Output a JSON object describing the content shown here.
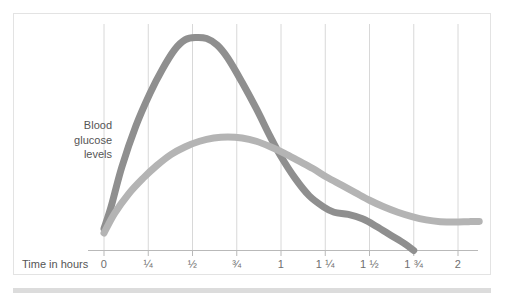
{
  "figure": {
    "name": "blood-glucose-time-chart",
    "panel_border_color": "#e3e3e3",
    "background_color": "#ffffff",
    "footer_bar_color": "#dcdcdc"
  },
  "chart_data": {
    "type": "line",
    "title": "",
    "xlabel": "Time in hours",
    "ylabel": "Blood glucose levels",
    "xlim": [
      0,
      2.125
    ],
    "ylim": [
      0,
      1
    ],
    "grid": true,
    "grid_axis": "x",
    "grid_color": "#d8d8d8",
    "axis_color": "#b9b9b9",
    "legend": "none",
    "xticks": [
      0,
      0.25,
      0.5,
      0.75,
      1,
      1.25,
      1.5,
      1.75,
      2
    ],
    "xticklabels": [
      "0",
      "¼",
      "½",
      "¾",
      "1",
      "1 ¼",
      "1 ½",
      "1 ¾",
      "2"
    ],
    "yticks": [],
    "yticklabels": [],
    "series": [
      {
        "name": "fast-acting-curve",
        "color": "#8f8f8f",
        "line_width": 7,
        "x": [
          0,
          0.04,
          0.1,
          0.18,
          0.26,
          0.33,
          0.4,
          0.46,
          0.52,
          0.58,
          0.64,
          0.7,
          0.78,
          0.86,
          0.94,
          1.0,
          1.08,
          1.16,
          1.24,
          1.3,
          1.38,
          1.46,
          1.54,
          1.62,
          1.7,
          1.75
        ],
        "y": [
          0.1,
          0.2,
          0.38,
          0.57,
          0.72,
          0.83,
          0.92,
          0.965,
          0.975,
          0.97,
          0.94,
          0.88,
          0.77,
          0.65,
          0.52,
          0.43,
          0.33,
          0.25,
          0.2,
          0.175,
          0.165,
          0.145,
          0.11,
          0.07,
          0.03,
          0.0
        ]
      },
      {
        "name": "slow-acting-curve",
        "color": "#b4b4b4",
        "line_width": 7,
        "x": [
          0,
          0.06,
          0.14,
          0.22,
          0.3,
          0.38,
          0.46,
          0.54,
          0.62,
          0.7,
          0.78,
          0.86,
          0.94,
          1.02,
          1.1,
          1.18,
          1.26,
          1.34,
          1.42,
          1.5,
          1.58,
          1.66,
          1.74,
          1.82,
          1.9,
          1.98,
          2.06,
          2.12
        ],
        "y": [
          0.08,
          0.17,
          0.26,
          0.33,
          0.39,
          0.44,
          0.475,
          0.5,
          0.515,
          0.52,
          0.515,
          0.5,
          0.475,
          0.445,
          0.41,
          0.375,
          0.335,
          0.3,
          0.265,
          0.23,
          0.2,
          0.175,
          0.155,
          0.14,
          0.132,
          0.13,
          0.132,
          0.133
        ]
      }
    ]
  },
  "labels": {
    "y_axis_line1": "Blood",
    "y_axis_line2": "glucose",
    "y_axis_line3": "levels",
    "x_axis": "Time in hours"
  }
}
